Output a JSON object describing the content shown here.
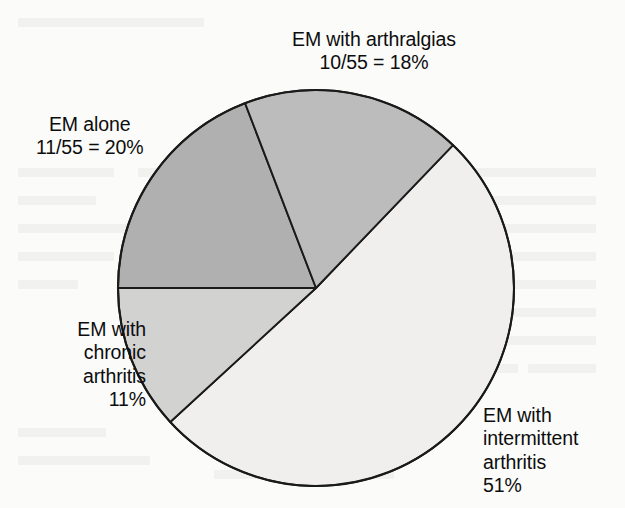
{
  "figure": {
    "background_color": "#fbfbfa",
    "outline_color": "#1a1a1a"
  },
  "labels": {
    "arthralgias": {
      "line1": "EM with arthralgias",
      "line2": "10/55 = 18%"
    },
    "em_alone": {
      "line1": "EM alone",
      "line2": "11/55 = 20%"
    },
    "chronic": {
      "line1": "EM with",
      "line2": "chronic",
      "line3": "arthritis",
      "line4": "11%"
    },
    "intermittent": {
      "line1": "EM with",
      "line2": "intermittent",
      "line3": "arthritis",
      "line4": "51%"
    }
  },
  "chart_data": {
    "type": "pie",
    "title": "",
    "subtitle": "",
    "xlabel": "",
    "ylabel": "",
    "legend_position": "none",
    "grid": false,
    "total_patients": 55,
    "units": "percent",
    "center": [
      316,
      288
    ],
    "radius": 198,
    "start_angle_deg": -111,
    "direction": "clockwise",
    "categories": [
      "EM with arthralgias",
      "EM with intermittent arthritis",
      "EM with chronic arthritis",
      "EM alone"
    ],
    "values": [
      18,
      51,
      11,
      20
    ],
    "counts": [
      10,
      null,
      null,
      11
    ],
    "labels": [
      "10/55 = 18%",
      "51%",
      "11%",
      "11/55 = 20%"
    ],
    "colors": [
      "#bcbcbc",
      "#f0efee",
      "#d2d2d1",
      "#b0b0b0"
    ],
    "slices": [
      {
        "name": "EM with arthralgias",
        "value": 18,
        "count": 10,
        "denominator": 55,
        "label": "10/55 = 18%",
        "color": "#bcbcbc",
        "start_deg": -111,
        "end_deg": -46.2
      },
      {
        "name": "EM with intermittent arthritis",
        "value": 51,
        "count": null,
        "denominator": 55,
        "label": "51%",
        "color": "#f0efee",
        "start_deg": -46.2,
        "end_deg": 137.4
      },
      {
        "name": "EM with chronic arthritis",
        "value": 11,
        "count": null,
        "denominator": 55,
        "label": "11%",
        "color": "#d2d2d1",
        "start_deg": 137.4,
        "end_deg": 180
      },
      {
        "name": "EM alone",
        "value": 20,
        "count": 11,
        "denominator": 55,
        "label": "11/55 = 20%",
        "color": "#b0b0b0",
        "start_deg": 180,
        "end_deg": 249
      }
    ]
  }
}
